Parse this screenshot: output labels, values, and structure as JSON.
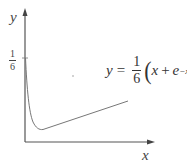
{
  "figure": {
    "y_axis_label": "y",
    "x_axis_label": "x",
    "y_tick": {
      "numerator": "1",
      "denominator": "6"
    },
    "equation": {
      "lhs": "y",
      "equals": "=",
      "frac_numerator": "1",
      "frac_denominator": "6",
      "open_paren": "(",
      "x": "x",
      "plus": "+",
      "e": "e",
      "exponent": "−x",
      "close_paren": ")"
    },
    "colors": {
      "axis": "#555555",
      "curve": "#777777",
      "text": "#333333"
    }
  }
}
